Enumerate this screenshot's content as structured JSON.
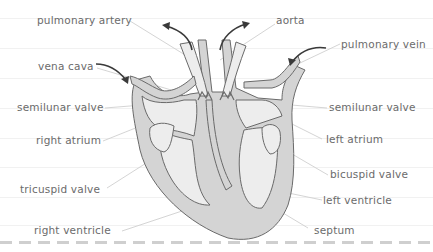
{
  "diagram": {
    "colors": {
      "background": "#ffffff",
      "wall_fill": "#d4d4d4",
      "chamber_fill": "#ededed",
      "outline": "#6a6a6a",
      "leader_line": "#cfcfcf",
      "label_text": "#6b6b6b",
      "arrow": "#3a3a3a",
      "rule_line": "#f1f1f1",
      "dash_line": "#cfcfcf"
    },
    "labels_left": [
      {
        "id": "pulmonary-artery",
        "text": "pulmonary artery"
      },
      {
        "id": "vena-cava",
        "text": "vena cava"
      },
      {
        "id": "semilunar-valve-left",
        "text": "semilunar valve"
      },
      {
        "id": "right-atrium",
        "text": "right atrium"
      },
      {
        "id": "tricuspid-valve",
        "text": "tricuspid valve"
      },
      {
        "id": "right-ventricle",
        "text": "right ventricle"
      }
    ],
    "labels_right": [
      {
        "id": "aorta",
        "text": "aorta"
      },
      {
        "id": "pulmonary-vein",
        "text": "pulmonary vein"
      },
      {
        "id": "semilunar-valve-right",
        "text": "semilunar valve"
      },
      {
        "id": "left-atrium",
        "text": "left atrium"
      },
      {
        "id": "bicuspid-valve",
        "text": "bicuspid valve"
      },
      {
        "id": "left-ventricle",
        "text": "left ventricle"
      },
      {
        "id": "septum",
        "text": "septum"
      }
    ],
    "arrows": [
      {
        "id": "pulmonary-artery-flow",
        "direction": "out-up-left"
      },
      {
        "id": "aorta-flow",
        "direction": "out-up-right"
      },
      {
        "id": "vena-cava-flow",
        "direction": "in-down-right"
      },
      {
        "id": "pulmonary-vein-flow",
        "direction": "in-down-left"
      }
    ]
  }
}
